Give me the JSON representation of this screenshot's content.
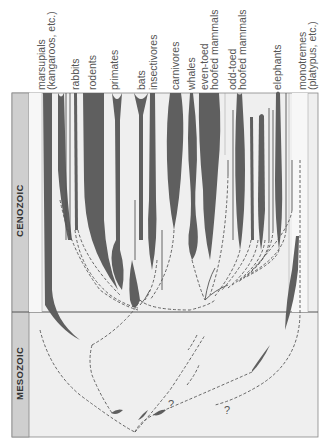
{
  "figure": {
    "orientation": "rotated 90 degrees counter-clockwise",
    "colors": {
      "background": "#ffffff",
      "panel": "#efefef",
      "era_band": "#cfcfcf",
      "lineage_fill": "#5f5f5f",
      "line": "#555555",
      "label_text": "#555555"
    }
  },
  "eras": [
    {
      "name": "CENOZOIC"
    },
    {
      "name": "MESOZOIC"
    }
  ],
  "groups": [
    {
      "id": "marsupials",
      "line1": "marsupials",
      "line2": "(kangaroos, etc.)"
    },
    {
      "id": "rabbits",
      "line1": "rabbits",
      "line2": ""
    },
    {
      "id": "rodents",
      "line1": "rodents",
      "line2": ""
    },
    {
      "id": "primates",
      "line1": "primates",
      "line2": ""
    },
    {
      "id": "bats",
      "line1": "bats",
      "line2": ""
    },
    {
      "id": "insectivores",
      "line1": "insectivores",
      "line2": ""
    },
    {
      "id": "carnivores",
      "line1": "carnivores",
      "line2": ""
    },
    {
      "id": "whales",
      "line1": "whales",
      "line2": ""
    },
    {
      "id": "even-toed",
      "line1": "even-toed",
      "line2": "hoofed mammals"
    },
    {
      "id": "odd-toed",
      "line1": "odd-toed",
      "line2": "hoofed mammals"
    },
    {
      "id": "elephants",
      "line1": "elephants",
      "line2": ""
    },
    {
      "id": "monotremes",
      "line1": "monotremes",
      "line2": "(platypus, etc.)"
    }
  ],
  "annotations": {
    "uncertain_1": "?",
    "uncertain_2": "?"
  }
}
